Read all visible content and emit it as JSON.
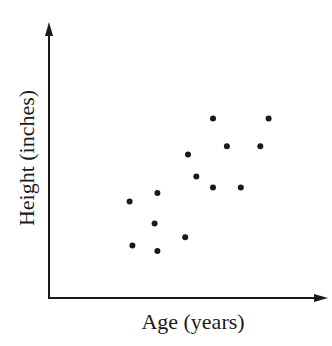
{
  "chart_data": {
    "type": "scatter",
    "title": "",
    "xlabel": "Age (years)",
    "ylabel": "Height (inches)",
    "grid": false,
    "legend": null,
    "ticks": {
      "x": [],
      "y": []
    },
    "axis_style": "arrows, no tick marks or numeric labels",
    "note": "Values are in relative plot units (0-100) since the axes have no numeric scale",
    "xlim": [
      0,
      100
    ],
    "ylim": [
      0,
      100
    ],
    "points": [
      {
        "x": 29,
        "y": 35
      },
      {
        "x": 30,
        "y": 19
      },
      {
        "x": 39,
        "y": 38
      },
      {
        "x": 38,
        "y": 27
      },
      {
        "x": 39,
        "y": 17
      },
      {
        "x": 49,
        "y": 22
      },
      {
        "x": 50,
        "y": 52
      },
      {
        "x": 53,
        "y": 44
      },
      {
        "x": 59,
        "y": 40
      },
      {
        "x": 59,
        "y": 65
      },
      {
        "x": 64,
        "y": 55
      },
      {
        "x": 69,
        "y": 40
      },
      {
        "x": 76,
        "y": 55
      },
      {
        "x": 79,
        "y": 65
      }
    ],
    "marker_color": "#1a1a1a",
    "axis_color": "#1a1a1a"
  }
}
